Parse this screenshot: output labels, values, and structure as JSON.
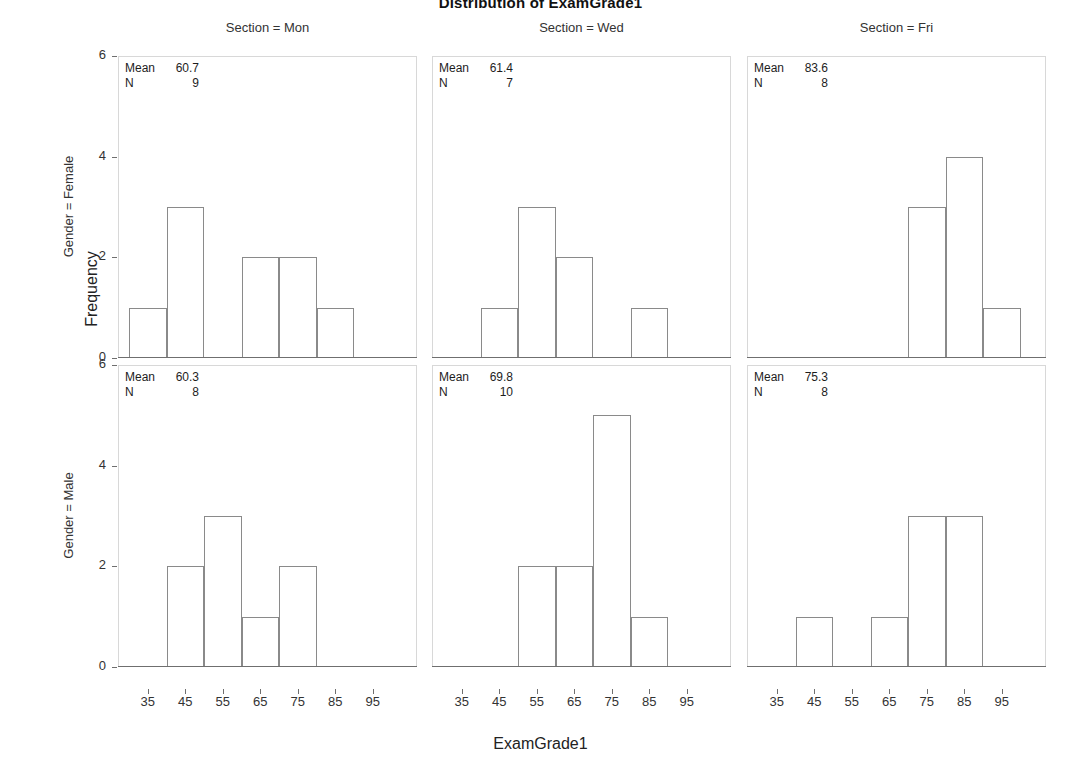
{
  "title": "Distribution of ExamGrade1",
  "axes": {
    "x_label": "ExamGrade1",
    "y_label": "Frequency",
    "x_ticks": [
      "35",
      "45",
      "55",
      "65",
      "75",
      "85",
      "95"
    ],
    "y_ticks": [
      "0",
      "2",
      "4",
      "6"
    ]
  },
  "column_headers": [
    "Section = Mon",
    "Section = Wed",
    "Section = Fri"
  ],
  "row_labels": [
    "Gender = Female",
    "Gender = Male"
  ],
  "stat_labels": {
    "mean": "Mean",
    "n": "N"
  },
  "panels": [
    {
      "row": 0,
      "col": 0,
      "mean": "60.7",
      "n": "9"
    },
    {
      "row": 0,
      "col": 1,
      "mean": "61.4",
      "n": "7"
    },
    {
      "row": 0,
      "col": 2,
      "mean": "83.6",
      "n": "8"
    },
    {
      "row": 1,
      "col": 0,
      "mean": "60.3",
      "n": "8"
    },
    {
      "row": 1,
      "col": 1,
      "mean": "69.8",
      "n": "10"
    },
    {
      "row": 1,
      "col": 2,
      "mean": "75.3",
      "n": "8"
    }
  ],
  "chart_data": {
    "type": "bar",
    "title": "Distribution of ExamGrade1",
    "xlabel": "ExamGrade1",
    "ylabel": "Frequency",
    "ylim": [
      0,
      6
    ],
    "grid": false,
    "legend": "none",
    "layout": "3 columns (Section) x 2 rows (Gender) panel grid of histograms",
    "bin_centers": [
      35,
      45,
      55,
      65,
      75,
      85,
      95
    ],
    "bin_width": 10,
    "categories": [
      "35",
      "45",
      "55",
      "65",
      "75",
      "85",
      "95"
    ],
    "series": [
      {
        "name": "Gender = Female, Section = Mon",
        "row": 0,
        "col": 0,
        "mean": 60.7,
        "n": 9,
        "values": [
          1,
          3,
          0,
          2,
          2,
          1,
          0
        ]
      },
      {
        "name": "Gender = Female, Section = Wed",
        "row": 0,
        "col": 1,
        "mean": 61.4,
        "n": 7,
        "values": [
          0,
          1,
          3,
          2,
          0,
          1,
          0
        ]
      },
      {
        "name": "Gender = Female, Section = Fri",
        "row": 0,
        "col": 2,
        "mean": 83.6,
        "n": 8,
        "values": [
          0,
          0,
          0,
          0,
          3,
          4,
          1
        ]
      },
      {
        "name": "Gender = Male, Section = Mon",
        "row": 1,
        "col": 0,
        "mean": 60.3,
        "n": 8,
        "values": [
          0,
          2,
          3,
          1,
          2,
          0,
          0
        ]
      },
      {
        "name": "Gender = Male, Section = Wed",
        "row": 1,
        "col": 1,
        "mean": 69.8,
        "n": 10,
        "values": [
          0,
          0,
          2,
          2,
          5,
          1,
          0
        ]
      },
      {
        "name": "Gender = Male, Section = Fri",
        "row": 1,
        "col": 2,
        "mean": 75.3,
        "n": 8,
        "values": [
          0,
          1,
          0,
          1,
          3,
          3,
          0
        ]
      }
    ]
  }
}
